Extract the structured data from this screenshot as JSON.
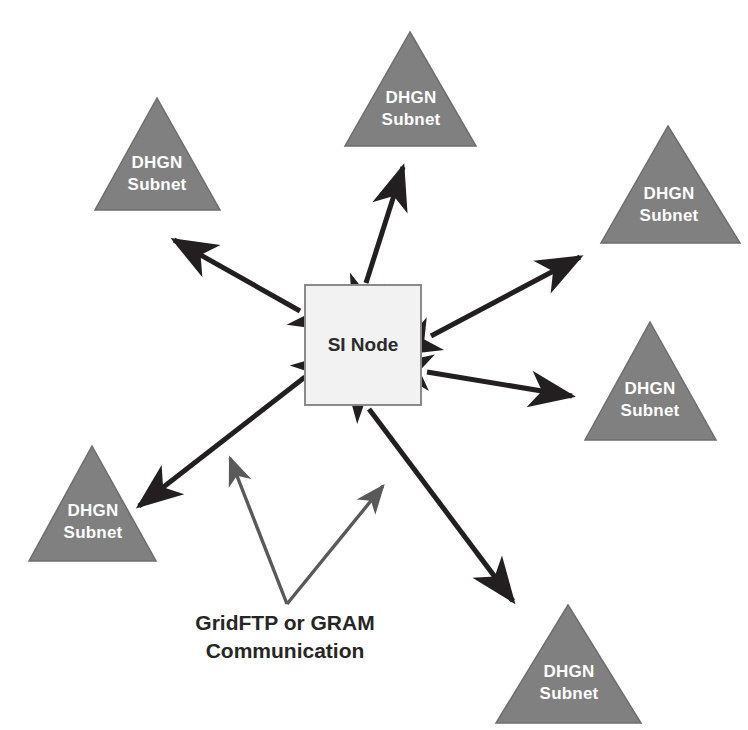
{
  "diagram": {
    "background_color": "#ffffff",
    "colors": {
      "triangle_fill": "#808080",
      "triangle_stroke": "#6e6e6e",
      "node_fill": "#f2f2f2",
      "node_stroke": "#8a8a8a",
      "arrow_color": "#231f20",
      "callout_color": "#595959",
      "subnet_text": "#ffffff",
      "node_text": "#2b2b2b",
      "caption_text": "#262626"
    },
    "center_node": {
      "label": "SI Node",
      "shape": "rectangle",
      "x": 305,
      "y": 285,
      "width": 116,
      "height": 120
    },
    "subnets": [
      {
        "id": "subnet-top-left",
        "line1": "DHGN",
        "line2": "Subnet",
        "apex_x": 157,
        "apex_y": 98,
        "base_left_x": 95,
        "base_right_x": 220,
        "base_y": 210
      },
      {
        "id": "subnet-top-center",
        "line1": "DHGN",
        "line2": "Subnet",
        "apex_x": 410,
        "apex_y": 32,
        "base_left_x": 345,
        "base_right_x": 476,
        "base_y": 146
      },
      {
        "id": "subnet-top-right",
        "line1": "DHGN",
        "line2": "Subnet",
        "apex_x": 668,
        "apex_y": 126,
        "base_left_x": 601,
        "base_right_x": 740,
        "base_y": 243
      },
      {
        "id": "subnet-right-middle",
        "line1": "DHGN",
        "line2": "Subnet",
        "apex_x": 650,
        "apex_y": 322,
        "base_left_x": 585,
        "base_right_x": 716,
        "base_y": 440
      },
      {
        "id": "subnet-bottom-left",
        "line1": "DHGN",
        "line2": "Subnet",
        "apex_x": 92,
        "apex_y": 446,
        "base_left_x": 29,
        "base_right_x": 156,
        "base_y": 561
      },
      {
        "id": "subnet-bottom-center",
        "line1": "DHGN",
        "line2": "Subnet",
        "apex_x": 568,
        "apex_y": 605,
        "base_left_x": 496,
        "base_right_x": 641,
        "base_y": 723
      }
    ],
    "connections": [
      {
        "id": "link-top-left",
        "from_x": 300,
        "from_y": 311,
        "to_x": 174,
        "to_y": 240,
        "double_headed": true
      },
      {
        "id": "link-top-center",
        "from_x": 366,
        "from_y": 283,
        "to_x": 403,
        "to_y": 167,
        "double_headed": true
      },
      {
        "id": "link-top-right",
        "from_x": 431,
        "from_y": 336,
        "to_x": 580,
        "to_y": 257,
        "double_headed": true
      },
      {
        "id": "link-right-middle",
        "from_x": 427,
        "from_y": 372,
        "to_x": 572,
        "to_y": 396,
        "double_headed": true
      },
      {
        "id": "link-bottom-left",
        "from_x": 305,
        "from_y": 377,
        "to_x": 139,
        "to_y": 506,
        "double_headed": true
      },
      {
        "id": "link-bottom-center",
        "from_x": 369,
        "from_y": 409,
        "to_x": 513,
        "to_y": 601,
        "double_headed": true
      }
    ],
    "caption": {
      "line1": "GridFTP or GRAM",
      "line2": "Communication",
      "line1_x": 285,
      "line1_y": 624,
      "line2_x": 285,
      "line2_y": 652
    },
    "callouts": [
      {
        "id": "callout-left",
        "from_x": 287,
        "from_y": 604,
        "to_x": 230,
        "to_y": 458
      },
      {
        "id": "callout-right",
        "from_x": 287,
        "from_y": 604,
        "to_x": 383,
        "to_y": 486
      }
    ]
  }
}
